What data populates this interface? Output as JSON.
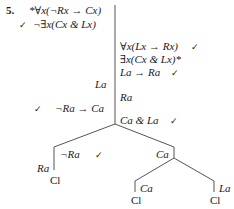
{
  "problem": {
    "number": "5.",
    "premise_1": "*∀x(¬Rx → Cx)",
    "premise_1_check": "",
    "premise_2": "¬∃x(Cx & Lx)",
    "premise_2_check": "✓"
  },
  "right_column": {
    "line_1": "∀x(Lx → Rx)",
    "line_1_check": "✓",
    "line_2": "∃x(Cx & Lx)*",
    "line_3": "La → Ra",
    "line_3_check": "✓",
    "line_4": "Ra",
    "line_5": "Ca & La",
    "line_5_check": "✓"
  },
  "left_column": {
    "la": "La",
    "neg_ra_to_ca": "¬Ra → Ca",
    "neg_ra_to_ca_check": "✓"
  },
  "tree": {
    "left_branch": {
      "node": "¬Ra",
      "node_check": "✓",
      "side_label": "Ra",
      "close": "Cl"
    },
    "right_branch": {
      "node": "Ca",
      "left_child": {
        "node": "Ca",
        "close": "Cl"
      },
      "right_child": {
        "node": "La",
        "close": "Cl"
      }
    }
  },
  "colors": {
    "ink": "#1a1a1a",
    "line": "#555555",
    "background": "#ffffff"
  }
}
